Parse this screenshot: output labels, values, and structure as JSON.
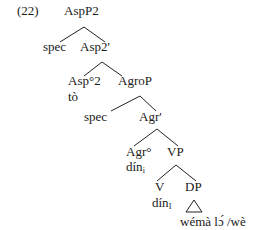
{
  "example_number": "(22)",
  "tree": {
    "root": "AspP2",
    "spec1": "spec",
    "asp2_bar": "Asp2'",
    "asp2_head": "Asp°2",
    "asp2_head_word": "tò",
    "agrop": "AgroP",
    "spec2": "spec",
    "agr_bar": "Agr'",
    "agr_head": "Agr°",
    "agr_head_word": "dín",
    "agr_head_index": "i",
    "vp": "VP",
    "v": "V",
    "v_word": "dín",
    "v_index": "I",
    "dp": "DP",
    "dp_content": "wémà lɔ́ /wè"
  }
}
